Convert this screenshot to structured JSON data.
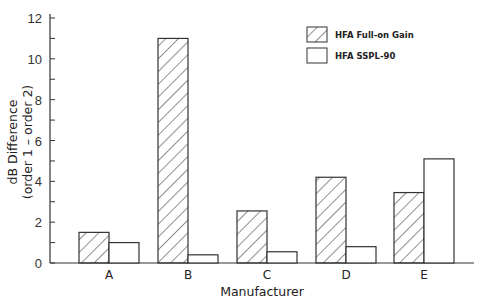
{
  "chart_data": {
    "type": "bar",
    "title": "",
    "xlabel": "Manufacturer",
    "ylabel": "dB Difference",
    "ylabel_line2": "(order 1 – order 2)",
    "categories": [
      "A",
      "B",
      "C",
      "D",
      "E"
    ],
    "series": [
      {
        "name": "HFA Full-on Gain",
        "pattern": "hatched",
        "values": [
          1.5,
          11.0,
          2.55,
          4.2,
          3.45
        ]
      },
      {
        "name": "HFA SSPL-90",
        "pattern": "plain",
        "values": [
          1.0,
          0.4,
          0.55,
          0.8,
          5.1
        ]
      }
    ],
    "ylim": [
      0,
      12
    ],
    "yticks": [
      0,
      2,
      4,
      6,
      8,
      10,
      12
    ],
    "yminor_step": 1,
    "grid": false,
    "legend_position": "upper right",
    "colors": {
      "stroke": "#333333",
      "fill": "#ffffff",
      "hatch": "#333333"
    }
  }
}
